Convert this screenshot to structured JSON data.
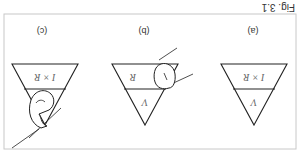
{
  "figure": {
    "caption": "Fig. 3.1",
    "orientation": "rotated-180",
    "frame_color": "#c8c8c8",
    "line_color": "#222222",
    "panels": [
      {
        "id": "a",
        "label": "(a)",
        "top_text": "I × R",
        "bottom_text": "V",
        "covered": "none"
      },
      {
        "id": "b",
        "label": "(b)",
        "top_text": "R",
        "bottom_text": "V",
        "covered": "I"
      },
      {
        "id": "c",
        "label": "(c)",
        "top_text": "I × R",
        "bottom_text": "",
        "covered": "V"
      }
    ]
  }
}
